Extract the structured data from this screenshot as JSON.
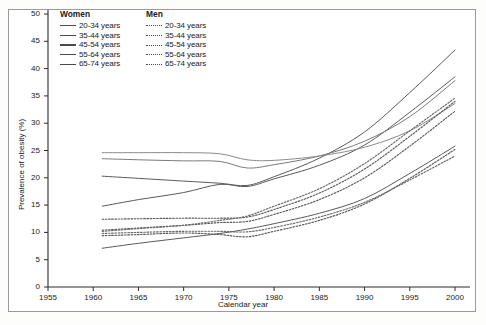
{
  "chart_data": {
    "type": "line",
    "title": "",
    "xlabel": "Calendar year",
    "ylabel": "Prevalence of obesity (%)",
    "xlim": [
      1955,
      2002
    ],
    "ylim": [
      0,
      50
    ],
    "xticks": [
      1955,
      1960,
      1965,
      1970,
      1975,
      1980,
      1985,
      1990,
      1995,
      2000
    ],
    "yticks": [
      0,
      5,
      10,
      15,
      20,
      25,
      30,
      35,
      40,
      45,
      50
    ],
    "grid": false,
    "legend_position": "top-left",
    "legend_groups": [
      {
        "heading": "Women",
        "style": "solid",
        "entries": [
          "20-34 years",
          "35-44 years",
          "45-54 years",
          "55-64 years",
          "65-74 years"
        ]
      },
      {
        "heading": "Men",
        "style": "dashed",
        "entries": [
          "20-34 years",
          "35-44 years",
          "45-54 years",
          "55-64 years",
          "65-74 years"
        ]
      }
    ],
    "series": [
      {
        "name": "Women 20-34 years",
        "sex": "Women",
        "age": "20-34 years",
        "style": "solid",
        "color": "#5a5a5a",
        "x": [
          1961,
          1965,
          1970,
          1974,
          1977,
          1980,
          1985,
          1990,
          1995,
          2000
        ],
        "values": [
          7.1,
          8.0,
          9.0,
          9.8,
          10.6,
          11.6,
          13.5,
          16.2,
          20.8,
          25.8
        ]
      },
      {
        "name": "Women 35-44 years",
        "sex": "Women",
        "age": "35-44 years",
        "style": "solid",
        "color": "#5a5a5a",
        "x": [
          1961,
          1965,
          1970,
          1974,
          1977,
          1980,
          1985,
          1990,
          1995,
          2000
        ],
        "values": [
          14.8,
          16.0,
          17.3,
          18.8,
          18.4,
          19.8,
          22.3,
          26.0,
          32.0,
          38.5
        ]
      },
      {
        "name": "Women 45-54 years",
        "sex": "Women",
        "age": "45-54 years",
        "style": "solid",
        "color": "#5a5a5a",
        "x": [
          1961,
          1965,
          1970,
          1974,
          1977,
          1980,
          1985,
          1990,
          1995,
          2000
        ],
        "values": [
          20.3,
          19.9,
          19.4,
          19.0,
          18.6,
          20.2,
          23.6,
          28.4,
          35.6,
          43.4
        ]
      },
      {
        "name": "Women 55-64 years",
        "sex": "Women",
        "age": "55-64 years",
        "style": "solid",
        "color": "#7a7a7a",
        "x": [
          1961,
          1965,
          1970,
          1974,
          1977,
          1980,
          1985,
          1990,
          1995,
          2000
        ],
        "values": [
          23.5,
          23.3,
          23.1,
          23.0,
          21.8,
          22.4,
          24.0,
          26.7,
          31.2,
          37.8
        ]
      },
      {
        "name": "Women 65-74 years",
        "sex": "Women",
        "age": "65-74 years",
        "style": "solid",
        "color": "#8a8a8a",
        "x": [
          1961,
          1965,
          1970,
          1974,
          1977,
          1980,
          1985,
          1990,
          1995,
          2000
        ],
        "values": [
          24.6,
          24.6,
          24.6,
          24.4,
          23.3,
          23.2,
          24.0,
          25.6,
          28.6,
          33.6
        ]
      },
      {
        "name": "Men 20-34 years",
        "sex": "Men",
        "age": "20-34 years",
        "style": "dashed",
        "color": "#5a5a5a",
        "x": [
          1961,
          1965,
          1970,
          1974,
          1977,
          1980,
          1985,
          1990,
          1995,
          2000
        ],
        "values": [
          9.4,
          9.6,
          9.9,
          9.6,
          9.2,
          10.2,
          12.2,
          15.2,
          19.9,
          25.2
        ]
      },
      {
        "name": "Men 35-44 years",
        "sex": "Men",
        "age": "35-44 years",
        "style": "dashed",
        "color": "#5a5a5a",
        "x": [
          1961,
          1965,
          1970,
          1974,
          1977,
          1980,
          1985,
          1990,
          1995,
          2000
        ],
        "values": [
          10.4,
          10.8,
          11.3,
          11.8,
          12.0,
          13.3,
          16.0,
          20.0,
          25.8,
          32.2
        ]
      },
      {
        "name": "Men 45-54 years",
        "sex": "Men",
        "age": "45-54 years",
        "style": "dashed",
        "color": "#5a5a5a",
        "x": [
          1961,
          1965,
          1970,
          1974,
          1977,
          1980,
          1985,
          1990,
          1995,
          2000
        ],
        "values": [
          12.4,
          12.5,
          12.6,
          12.6,
          12.8,
          14.2,
          17.2,
          21.6,
          27.6,
          34.0
        ]
      },
      {
        "name": "Men 55-64 years",
        "sex": "Men",
        "age": "55-64 years",
        "style": "dashed",
        "color": "#6a6a6a",
        "x": [
          1961,
          1965,
          1970,
          1974,
          1977,
          1980,
          1985,
          1990,
          1995,
          2000
        ],
        "values": [
          10.2,
          10.7,
          11.3,
          12.2,
          13.0,
          14.8,
          18.0,
          22.6,
          28.6,
          34.6
        ]
      },
      {
        "name": "Men 65-74 years",
        "sex": "Men",
        "age": "65-74 years",
        "style": "dashed",
        "color": "#6a6a6a",
        "x": [
          1961,
          1965,
          1970,
          1974,
          1977,
          1980,
          1985,
          1990,
          1995,
          2000
        ],
        "values": [
          9.8,
          10.0,
          10.2,
          10.2,
          10.1,
          10.9,
          12.8,
          15.5,
          19.6,
          24.0
        ]
      }
    ]
  }
}
